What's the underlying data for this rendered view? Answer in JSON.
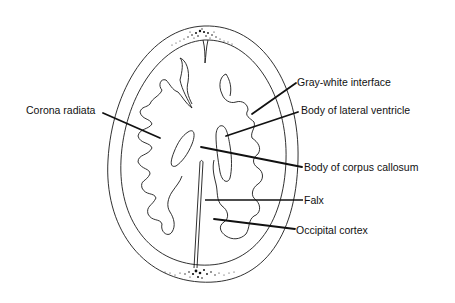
{
  "diagram": {
    "labels": {
      "gray_white_interface": "Gray-white interface",
      "body_lateral_ventricle": "Body of lateral ventricle",
      "corona_radiata": "Corona radiata",
      "body_corpus_callosum": "Body of corpus callosum",
      "falx": "Falx",
      "occipital_cortex": "Occipital cortex"
    },
    "colors": {
      "stroke": "#1a1a1a",
      "background": "#ffffff",
      "text": "#111111"
    }
  }
}
